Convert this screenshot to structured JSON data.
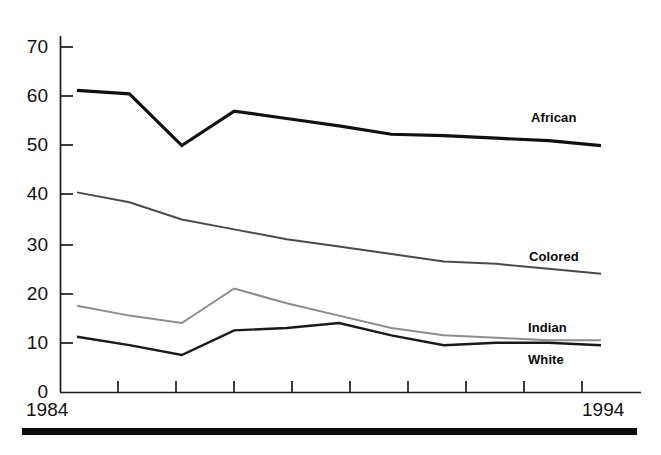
{
  "chart_data": {
    "type": "line",
    "title": "",
    "subtitle": "",
    "xlabel": "",
    "ylabel": "",
    "x": [
      1984,
      1985,
      1986,
      1987,
      1988,
      1989,
      1990,
      1991,
      1992,
      1993,
      1994
    ],
    "xtick_labels_shown": [
      "1984",
      "1994"
    ],
    "xlim": [
      1984,
      1994
    ],
    "ylim": [
      0,
      70
    ],
    "yticks": [
      0,
      10,
      20,
      30,
      40,
      50,
      60,
      70
    ],
    "ytick_labels": [
      "0",
      "10",
      "20",
      "30",
      "40",
      "50",
      "60",
      "70"
    ],
    "grid": false,
    "legend_position": "inline-right-of-lines",
    "series": [
      {
        "name": "African",
        "color": "#111111",
        "line_width": 3.2,
        "values": [
          61.2,
          60.5,
          50.0,
          57.0,
          55.5,
          54.0,
          52.3,
          52.0,
          51.5,
          51.0,
          50.0
        ]
      },
      {
        "name": "Colored",
        "color": "#4a4a4a",
        "line_width": 2.0,
        "values": [
          40.5,
          38.5,
          35.0,
          33.0,
          31.0,
          29.5,
          28.0,
          26.5,
          26.0,
          25.0,
          24.0
        ]
      },
      {
        "name": "Indian",
        "color": "#8c8c8c",
        "line_width": 2.0,
        "values": [
          17.5,
          15.5,
          14.0,
          21.0,
          18.0,
          15.5,
          13.0,
          11.5,
          11.0,
          10.5,
          10.5
        ]
      },
      {
        "name": "White",
        "color": "#1a1a1a",
        "line_width": 2.4,
        "values": [
          11.2,
          9.5,
          7.5,
          12.5,
          13.0,
          14.0,
          11.5,
          9.5,
          10.0,
          10.0,
          9.5
        ]
      }
    ],
    "annotations": [
      {
        "text": "African",
        "x": 1992.6,
        "y": 55.5
      },
      {
        "text": "Colored",
        "x": 1992.3,
        "y": 27.8
      },
      {
        "text": "Indian",
        "x": 1992.3,
        "y": 13.3
      },
      {
        "text": "White",
        "x": 1992.3,
        "y": 7.2
      }
    ]
  },
  "axes": {
    "y_tick_labels": [
      "70",
      "60",
      "50",
      "40",
      "30",
      "20",
      "10",
      "0"
    ],
    "x_start_label": "1984",
    "x_end_label": "1994"
  },
  "series_labels": {
    "african": "African",
    "colored": "Colored",
    "indian": "Indian",
    "white": "White"
  },
  "colors": {
    "african": "#111111",
    "colored": "#4a4a4a",
    "indian": "#8c8c8c",
    "white": "#1a1a1a",
    "axis": "#1b1b1b",
    "footer_rule": "#0c0c0c",
    "background": "#ffffff"
  }
}
